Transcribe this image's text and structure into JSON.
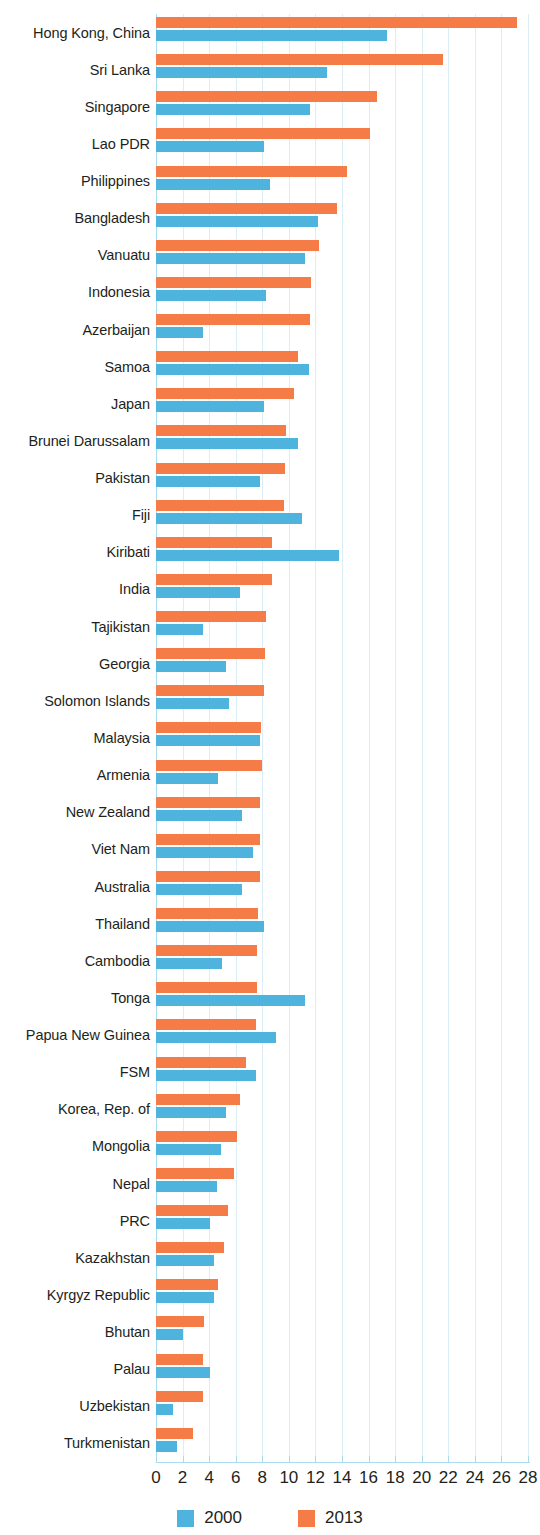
{
  "chart_data": {
    "type": "bar",
    "orientation": "horizontal",
    "title": "",
    "subtitle": "",
    "xlabel": "",
    "ylabel": "",
    "xlim": [
      0,
      28
    ],
    "xticks": [
      0,
      2,
      4,
      6,
      8,
      10,
      12,
      14,
      16,
      18,
      20,
      22,
      24,
      26,
      28
    ],
    "xtick_labels": [
      "0",
      "2",
      "4",
      "6",
      "8",
      "10",
      "12",
      "14",
      "16",
      "18",
      "20",
      "22",
      "24",
      "26",
      "28"
    ],
    "grid": "vertical",
    "legend_position": "bottom-center",
    "colors": {
      "2000": "#4eb4dd",
      "2013": "#f57c46",
      "gridline": "#dceef5",
      "axis": "#a9dcee",
      "text": "#231f20"
    },
    "categories": [
      "Hong Kong, China",
      "Sri Lanka",
      "Singapore",
      "Lao PDR",
      "Philippines",
      "Bangladesh",
      "Vanuatu",
      "Indonesia",
      "Azerbaijan",
      "Samoa",
      "Japan",
      "Brunei Darussalam",
      "Pakistan",
      "Fiji",
      "Kiribati",
      "India",
      "Tajikistan",
      "Georgia",
      "Solomon Islands",
      "Malaysia",
      "Armenia",
      "New Zealand",
      "Viet Nam",
      "Australia",
      "Thailand",
      "Cambodia",
      "Tonga",
      "Papua New Guinea",
      "FSM",
      "Korea, Rep. of",
      "Mongolia",
      "Nepal",
      "PRC",
      "Kazakhstan",
      "Kyrgyz Republic",
      "Bhutan",
      "Palau",
      "Uzbekistan",
      "Turkmenistan"
    ],
    "series": [
      {
        "name": "2013",
        "color": "#f57c46",
        "values": [
          27.2,
          21.6,
          16.6,
          16.1,
          14.4,
          13.6,
          12.3,
          11.7,
          11.6,
          10.7,
          10.4,
          9.8,
          9.7,
          9.6,
          8.7,
          8.7,
          8.3,
          8.2,
          8.1,
          7.9,
          8.0,
          7.8,
          7.8,
          7.8,
          7.7,
          7.6,
          7.6,
          7.5,
          6.8,
          6.3,
          6.1,
          5.9,
          5.4,
          5.1,
          4.7,
          3.6,
          3.5,
          3.5,
          2.8
        ]
      },
      {
        "name": "2000",
        "color": "#4eb4dd",
        "values": [
          17.4,
          12.9,
          11.6,
          8.1,
          8.6,
          12.2,
          11.2,
          8.3,
          3.5,
          11.5,
          8.1,
          10.7,
          7.8,
          11.0,
          13.8,
          6.3,
          3.5,
          5.3,
          5.5,
          7.8,
          4.7,
          6.5,
          7.3,
          6.5,
          8.1,
          5.0,
          11.2,
          9.0,
          7.5,
          5.3,
          4.9,
          4.6,
          4.1,
          4.4,
          4.4,
          2.0,
          4.1,
          1.3,
          1.6
        ]
      }
    ]
  },
  "legend": {
    "items": [
      {
        "label": "2000",
        "color": "#4eb4dd"
      },
      {
        "label": "2013",
        "color": "#f57c46"
      }
    ]
  }
}
